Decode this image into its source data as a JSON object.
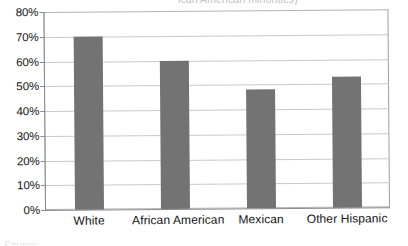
{
  "chart_data": {
    "type": "bar",
    "title": "ican American minorities)",
    "title_note": "title is cropped off the top edge of the image",
    "categories": [
      "White",
      "African American",
      "Mexican",
      "Other Hispanic"
    ],
    "values": [
      70,
      60,
      48,
      53
    ],
    "xlabel": "",
    "ylabel": "",
    "ylim": [
      0,
      80
    ],
    "ytick_values": [
      80,
      70,
      60,
      50,
      40,
      30,
      20,
      10,
      0
    ],
    "ytick_labels": [
      "80%",
      "70%",
      "60%",
      "50%",
      "40%",
      "30%",
      "20%",
      "10%",
      "0%"
    ],
    "grid": true,
    "legend": false,
    "series": [
      {
        "name": "",
        "values": [
          70,
          60,
          48,
          53
        ]
      }
    ],
    "colors": {
      "bar": "#737373",
      "gridline": "#c9c9c9",
      "axis": "#8c8c8c",
      "frame": "#b4b4b4",
      "text": "#111111",
      "background": "#ffffff"
    }
  },
  "artifacts": {
    "bottom_cut_text": "Source: ..."
  }
}
